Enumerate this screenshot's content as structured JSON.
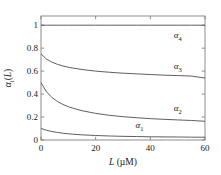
{
  "chart_data": {
    "type": "line",
    "title": "",
    "xlabel": "L (μM)",
    "ylabel": "αi(L)",
    "xlim": [
      0,
      60
    ],
    "ylim": [
      0,
      1.08
    ],
    "grid": false,
    "legend_position": "inline-annotations",
    "xticks": [
      0,
      20,
      40,
      60
    ],
    "xtick_labels": [
      "0",
      "20",
      "40",
      "60"
    ],
    "yticks": [
      0,
      0.2,
      0.4,
      0.6,
      0.8,
      1
    ],
    "ytick_labels": [
      "0",
      "0.2",
      "0.4",
      "0.6",
      "0.8",
      "1"
    ],
    "x": [
      0,
      2,
      4,
      6,
      8,
      10,
      12,
      15,
      20,
      25,
      30,
      35,
      40,
      45,
      50,
      55,
      60
    ],
    "series": [
      {
        "name": "α4",
        "label_base": "α",
        "label_sub": "4",
        "color": "#4d4d4d",
        "values": [
          1.0,
          1.0,
          1.0,
          1.0,
          1.0,
          1.0,
          1.0,
          1.0,
          1.0,
          1.0,
          1.0,
          1.0,
          1.0,
          1.0,
          1.0,
          1.0,
          1.0
        ],
        "annotation_x": 50,
        "annotation_y": 0.9
      },
      {
        "name": "α3",
        "label_base": "α",
        "label_sub": "3",
        "color": "#4d4d4d",
        "values": [
          0.75,
          0.705,
          0.678,
          0.659,
          0.645,
          0.634,
          0.625,
          0.614,
          0.6,
          0.59,
          0.582,
          0.576,
          0.57,
          0.565,
          0.561,
          0.557,
          0.54
        ],
        "annotation_x": 50,
        "annotation_y": 0.625
      },
      {
        "name": "α2",
        "label_base": "α",
        "label_sub": "2",
        "color": "#4d4d4d",
        "values": [
          0.5,
          0.42,
          0.37,
          0.335,
          0.31,
          0.29,
          0.275,
          0.255,
          0.232,
          0.215,
          0.203,
          0.194,
          0.186,
          0.18,
          0.175,
          0.17,
          0.163
        ],
        "annotation_x": 50,
        "annotation_y": 0.265
      },
      {
        "name": "α1",
        "label_base": "α",
        "label_sub": "1",
        "color": "#4d4d4d",
        "values": [
          0.1,
          0.085,
          0.074,
          0.066,
          0.059,
          0.054,
          0.05,
          0.045,
          0.039,
          0.035,
          0.032,
          0.03,
          0.028,
          0.027,
          0.026,
          0.025,
          0.024
        ],
        "annotation_x": 36,
        "annotation_y": 0.115
      }
    ],
    "axis_color": "#808080",
    "frame": true
  }
}
